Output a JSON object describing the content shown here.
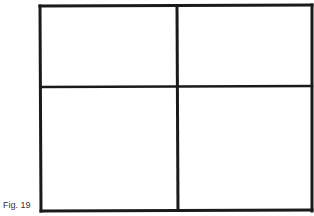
{
  "figure": {
    "caption": "Fig. 19",
    "line_color": "#1a1a1a",
    "outer_box": {
      "x1": 40,
      "y1": 5,
      "x2": 312,
      "y2": 211
    },
    "vertical_divider_x": 178,
    "horizontal_divider_y": 87
  }
}
